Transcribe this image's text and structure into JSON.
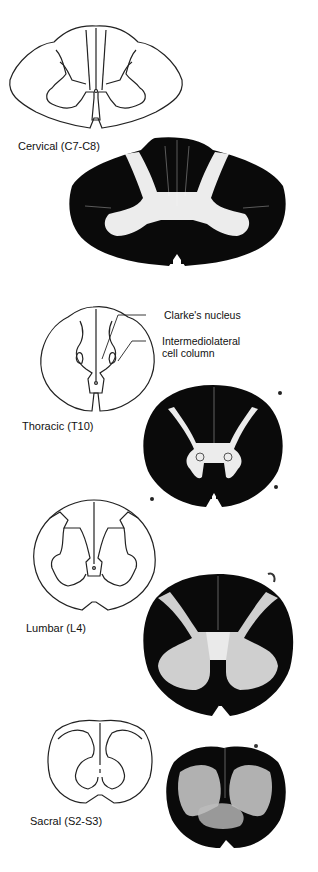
{
  "figure": {
    "sections": [
      {
        "id": "cervical",
        "label": "Cervical (C7-C8)",
        "diagram_stroke": "#222222",
        "section_color": "#0a0a0a",
        "gray_matter_color": "#efefef"
      },
      {
        "id": "thoracic",
        "label": "Thoracic (T10)",
        "diagram_stroke": "#222222",
        "section_color": "#0a0a0a",
        "gray_matter_color": "#efefef",
        "callouts": [
          {
            "text": "Clarke's nucleus"
          },
          {
            "text_line1": "Intermediolateral",
            "text_line2": "cell column"
          }
        ]
      },
      {
        "id": "lumbar",
        "label": "Lumbar (L4)",
        "diagram_stroke": "#222222",
        "section_color": "#0a0a0a",
        "gray_matter_color": "#d8d8d8"
      },
      {
        "id": "sacral",
        "label": "Sacral (S2-S3)",
        "diagram_stroke": "#222222",
        "section_color": "#0a0a0a",
        "gray_matter_color": "#cfcfcf"
      }
    ]
  }
}
